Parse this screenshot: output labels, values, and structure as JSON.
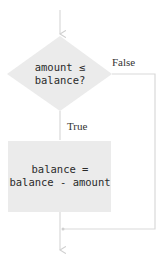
{
  "diagram": {
    "decision": {
      "line1": "amount ≤",
      "line2": "balance?"
    },
    "false_label": "False",
    "true_label": "True",
    "process": {
      "line1": "balance =",
      "line2": "balance - amount"
    },
    "colors": {
      "fill": "#ebebeb",
      "line": "#d9d9d9",
      "text": "#2a2a2a"
    }
  }
}
